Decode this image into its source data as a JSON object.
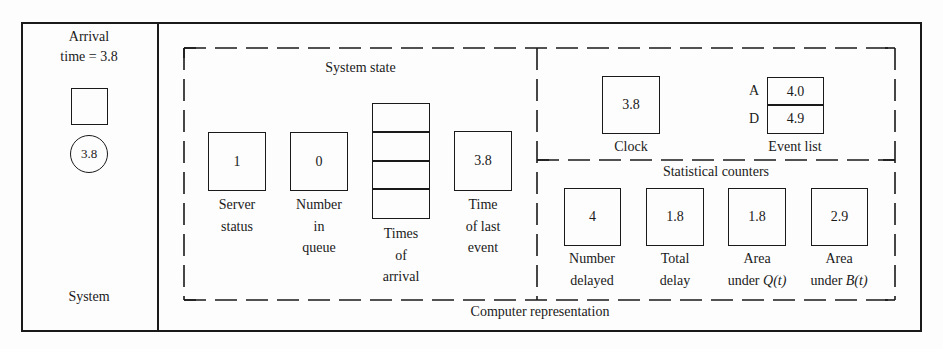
{
  "system_panel": {
    "arrival_line1": "Arrival",
    "arrival_line2": "time = 3.8",
    "customer_value": "3.8",
    "label": "System"
  },
  "computer_representation": {
    "label": "Computer representation",
    "system_state": {
      "title": "System state",
      "server_status": {
        "value": "1",
        "label_line1": "Server",
        "label_line2": "status"
      },
      "number_in_queue": {
        "value": "0",
        "label_line1": "Number",
        "label_line2": "in",
        "label_line3": "queue"
      },
      "times_of_arrival": {
        "slots": [
          "",
          "",
          "",
          ""
        ],
        "label_line1": "Times",
        "label_line2": "of",
        "label_line3": "arrival"
      },
      "time_of_last_event": {
        "value": "3.8",
        "label_line1": "Time",
        "label_line2": "of last",
        "label_line3": "event"
      }
    },
    "clock": {
      "value": "3.8",
      "label": "Clock"
    },
    "event_list": {
      "label": "Event list",
      "entries": [
        {
          "type": "A",
          "time": "4.0"
        },
        {
          "type": "D",
          "time": "4.9"
        }
      ]
    },
    "statistical_counters": {
      "title": "Statistical counters",
      "counters": [
        {
          "value": "4",
          "label_line1": "Number",
          "label_line2": "delayed"
        },
        {
          "value": "1.8",
          "label_line1": "Total",
          "label_line2": "delay"
        },
        {
          "value": "1.8",
          "label_line1": "Area",
          "label_line2": "under ",
          "label_var": "Q(t)"
        },
        {
          "value": "2.9",
          "label_line1": "Area",
          "label_line2": "under ",
          "label_var": "B(t)"
        }
      ]
    }
  }
}
